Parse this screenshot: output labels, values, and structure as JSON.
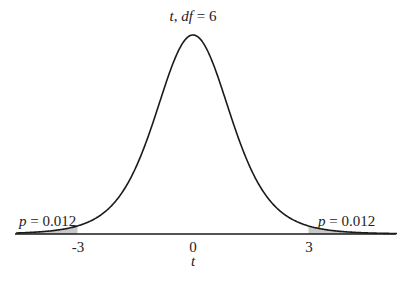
{
  "chart_data": {
    "type": "line",
    "title": "t, df = 6",
    "title_parts": {
      "var": "t",
      "df_label": "df",
      "df_value": "6"
    },
    "xlabel": "t",
    "ylabel": "",
    "distribution": "Student t",
    "df": 6,
    "xlim": [
      -4.6,
      5.3
    ],
    "x_ticks": [
      -3,
      0,
      3
    ],
    "x_tick_labels": [
      "-3",
      "0",
      "3"
    ],
    "shaded_regions": [
      {
        "from": -4.6,
        "to": -3,
        "label": "p = 0.012",
        "p": 0.012
      },
      {
        "from": 3,
        "to": 5.3,
        "label": "p = 0.012",
        "p": 0.012
      }
    ],
    "grid": false,
    "legend": null
  },
  "annotations": {
    "left_p_var": "p",
    "left_p_rest": " = 0.012",
    "right_p_var": "p",
    "right_p_rest": " = 0.012"
  },
  "colors": {
    "curve": "#1a1a1a",
    "shade": "#c8c8c8",
    "axis": "#1a1a1a"
  }
}
